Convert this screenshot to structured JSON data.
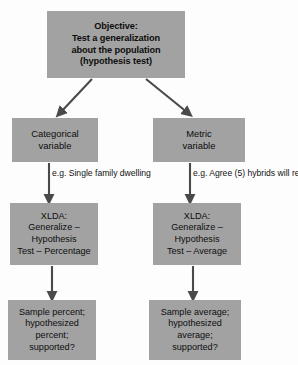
{
  "diagram": {
    "box_fill_color": "#a2a2a2",
    "text_color": "#0d0d0d",
    "background_color": "#fdfdfd",
    "connector_color": "#4a4a4a",
    "nodes": {
      "objective": {
        "lines": [
          "Objective:",
          "Test a generalization",
          "about the population",
          "(hypothesis test)"
        ]
      },
      "categorical": {
        "lines": [
          "Categorical",
          "variable"
        ]
      },
      "metric": {
        "lines": [
          "Metric",
          "variable"
        ]
      },
      "xlda_left": {
        "lines": [
          "XLDA:",
          "Generalize –",
          "Hypothesis",
          "Test – Percentage"
        ]
      },
      "xlda_right": {
        "lines": [
          "XLDA:",
          "Generalize –",
          "Hypothesis",
          "Test – Average"
        ]
      },
      "result_left": {
        "lines": [
          "Sample percent;",
          "hypothesized",
          "percent;",
          "supported?"
        ]
      },
      "result_right": {
        "lines": [
          "Sample average;",
          "hypothesized",
          "average;",
          "supported?"
        ]
      }
    },
    "edge_labels": {
      "categorical_example": {
        "lines": [
          "e.g. Single family",
          "dwelling"
        ]
      },
      "metric_example": {
        "lines": [
          "e.g. Agree (5) hybrids",
          "will reduce emissions"
        ]
      }
    }
  }
}
